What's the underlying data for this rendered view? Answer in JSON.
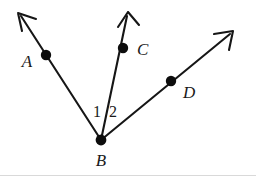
{
  "figure": {
    "background_color": "#ffffff",
    "ink_color": "#161616",
    "dot_color": "#0d0d0d",
    "rule_color": "#d9d9d9",
    "width": 256,
    "height": 178,
    "vertex": {
      "name": "B",
      "label": "B",
      "x": 101,
      "y": 140,
      "label_x": 101,
      "label_y": 166
    },
    "rays": [
      {
        "id": "ray-ba",
        "from": "B",
        "through": "A",
        "tip_x": 18,
        "tip_y": 13,
        "point": {
          "label": "A",
          "dot_x": 46,
          "dot_y": 55,
          "label_x": 27,
          "label_y": 67
        }
      },
      {
        "id": "ray-bc",
        "from": "B",
        "through": "C",
        "tip_x": 128,
        "tip_y": 12,
        "point": {
          "label": "C",
          "dot_x": 123,
          "dot_y": 48,
          "label_x": 137,
          "label_y": 55
        }
      },
      {
        "id": "ray-bd",
        "from": "B",
        "through": "D",
        "tip_x": 233,
        "tip_y": 31,
        "point": {
          "label": "D",
          "dot_x": 171,
          "dot_y": 81,
          "label_x": 183,
          "label_y": 98
        }
      }
    ],
    "angle_labels": [
      {
        "id": "angle-1",
        "text": "1",
        "x": 97,
        "y": 117
      },
      {
        "id": "angle-2",
        "text": "2",
        "x": 113,
        "y": 117
      }
    ],
    "baseline_rule": {
      "y": 175.5,
      "x1": 0,
      "x2": 256
    }
  }
}
